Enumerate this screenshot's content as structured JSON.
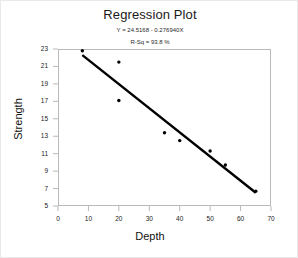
{
  "chart_data": {
    "type": "scatter",
    "title": "Regression Plot",
    "equation": "Y = 24.5168 - 0.276940X",
    "rsq": "R-Sq = 93.8 %",
    "xlabel": "Depth",
    "ylabel": "Strength",
    "xlim": [
      0,
      70
    ],
    "ylim": [
      5,
      23
    ],
    "xticks": [
      0,
      10,
      20,
      30,
      40,
      50,
      60,
      70
    ],
    "yticks": [
      5,
      7,
      9,
      11,
      13,
      15,
      17,
      19,
      21,
      23
    ],
    "xtick_labels": [
      "0",
      "10",
      "20",
      "30",
      "40",
      "50",
      "60",
      "70"
    ],
    "ytick_labels": [
      "5",
      "7",
      "9",
      "11",
      "13",
      "15",
      "17",
      "19",
      "21",
      "23"
    ],
    "grid": false,
    "legend": "none",
    "marker_color": "#000000",
    "line_color": "#000000",
    "frame_color": "#b9b9b9",
    "points": [
      {
        "x": 8,
        "y": 22.8
      },
      {
        "x": 20,
        "y": 21.5
      },
      {
        "x": 20,
        "y": 17.1
      },
      {
        "x": 35,
        "y": 13.4
      },
      {
        "x": 40,
        "y": 12.5
      },
      {
        "x": 50,
        "y": 11.3
      },
      {
        "x": 55,
        "y": 9.7
      },
      {
        "x": 65,
        "y": 6.7
      }
    ],
    "fit_line": {
      "intercept": 24.5168,
      "slope": -0.27694,
      "x_start": 8,
      "x_end": 65
    }
  }
}
